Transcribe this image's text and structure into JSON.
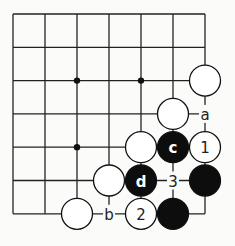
{
  "board": {
    "columns": 7,
    "rows": 7,
    "origin": [
      13,
      14
    ],
    "spacing": [
      32,
      33.3
    ],
    "line_color": "#222222",
    "background": "#fbfbf9",
    "hoshi": [
      [
        2,
        2
      ],
      [
        4,
        2
      ],
      [
        2,
        4
      ]
    ],
    "stones": [
      {
        "col": 6,
        "row": 2,
        "color": "white",
        "label": ""
      },
      {
        "col": 5,
        "row": 3,
        "color": "white",
        "label": ""
      },
      {
        "col": 4,
        "row": 4,
        "color": "white",
        "label": ""
      },
      {
        "col": 5,
        "row": 4,
        "color": "black",
        "label": "c"
      },
      {
        "col": 6,
        "row": 4,
        "color": "white",
        "label": "1"
      },
      {
        "col": 3,
        "row": 5,
        "color": "white",
        "label": ""
      },
      {
        "col": 4,
        "row": 5,
        "color": "black",
        "label": "d"
      },
      {
        "col": 6,
        "row": 5,
        "color": "black",
        "label": ""
      },
      {
        "col": 2,
        "row": 6,
        "color": "white",
        "label": ""
      },
      {
        "col": 4,
        "row": 6,
        "color": "white",
        "label": "2"
      },
      {
        "col": 5,
        "row": 6,
        "color": "black",
        "label": ""
      }
    ],
    "point_labels": [
      {
        "col": 6,
        "row": 3,
        "label": "a"
      },
      {
        "col": 5,
        "row": 5,
        "label": "3"
      },
      {
        "col": 3,
        "row": 6,
        "label": "b"
      }
    ]
  }
}
